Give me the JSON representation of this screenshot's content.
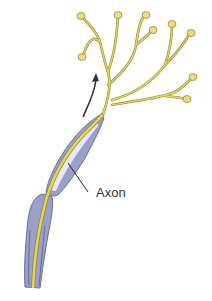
{
  "diagram": {
    "labels": {
      "axon": "Axon"
    },
    "colors": {
      "axon_core": "#e8d44d",
      "axon_outline": "#8a8a50",
      "myelin": "#9aa0c8",
      "myelin_dark": "#6a6f9a",
      "myelin_inner": "#e6e8f2",
      "arrow": "#333340",
      "label_line": "#222222",
      "terminal_fill": "#ecdc7a"
    },
    "elements": [
      "myelin-sheath-segment-upper",
      "myelin-sheath-segment-lower",
      "axon-core",
      "axon-terminal-branches",
      "synaptic-terminal-bulbs",
      "direction-arrow",
      "axon-label"
    ]
  }
}
